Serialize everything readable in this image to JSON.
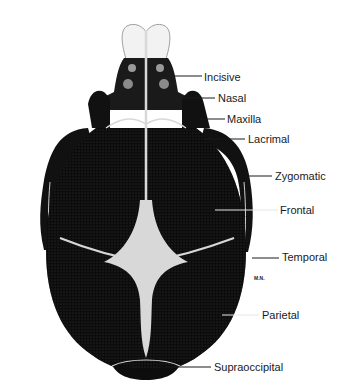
{
  "figure": {
    "colors": {
      "bone": "#0d0d0d",
      "suture": "#d8d8d8",
      "incisor": "#f2f2f2",
      "label": "#1a1a1a",
      "background": "#ffffff"
    },
    "labels": [
      {
        "id": "incisive",
        "text": "Incisive",
        "x": 204,
        "y": 71,
        "line_from": [
          172,
          76
        ],
        "line_to": [
          202,
          76
        ]
      },
      {
        "id": "nasal",
        "text": "Nasal",
        "x": 218,
        "y": 92,
        "line_from": [
          155,
          98
        ],
        "line_to": [
          215,
          98
        ]
      },
      {
        "id": "maxilla",
        "text": "Maxilla",
        "x": 227,
        "y": 113,
        "line_from": [
          200,
          119
        ],
        "line_to": [
          225,
          119
        ]
      },
      {
        "id": "lacrimal",
        "text": "Lacrimal",
        "x": 248,
        "y": 133,
        "line_from": [
          205,
          139
        ],
        "line_to": [
          245,
          139
        ]
      },
      {
        "id": "zygomatic",
        "text": "Zygomatic",
        "x": 275,
        "y": 170,
        "line_from": [
          248,
          176
        ],
        "line_to": [
          272,
          176
        ]
      },
      {
        "id": "frontal",
        "text": "Frontal",
        "x": 280,
        "y": 204,
        "line_from": [
          215,
          210
        ],
        "line_to": [
          278,
          210
        ]
      },
      {
        "id": "temporal",
        "text": "Temporal",
        "x": 282,
        "y": 251,
        "line_from": [
          252,
          258
        ],
        "line_to": [
          279,
          258
        ]
      },
      {
        "id": "parietal",
        "text": "Parietal",
        "x": 262,
        "y": 309,
        "line_from": [
          222,
          315
        ],
        "line_to": [
          259,
          315
        ]
      },
      {
        "id": "supraoccipital",
        "text": "Supraoccipital",
        "x": 214,
        "y": 361,
        "line_from": [
          165,
          367
        ],
        "line_to": [
          211,
          367
        ]
      }
    ],
    "signature": "M.N."
  }
}
